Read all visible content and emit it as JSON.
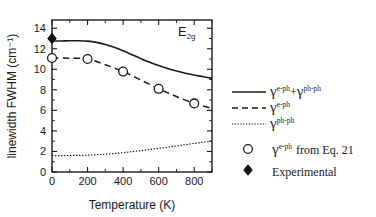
{
  "chart_data": {
    "type": "line",
    "title": "",
    "xlabel": "Temperature (K)",
    "ylabel": "linewidth FWHM (cm⁻¹)",
    "xlim": [
      0,
      900
    ],
    "ylim": [
      0,
      14.8
    ],
    "grid": false,
    "xticks": [
      0,
      200,
      400,
      600,
      800
    ],
    "xticklabels": [
      "0",
      "200",
      "400",
      "600",
      "800"
    ],
    "xminorticks": [
      100,
      300,
      500,
      700,
      900
    ],
    "yticks": [
      0,
      2,
      4,
      6,
      8,
      10,
      12,
      14
    ],
    "yticklabels": [
      "0",
      "2",
      "4",
      "6",
      "8",
      "10",
      "12",
      "14"
    ],
    "yminorticks": [
      1,
      3,
      5,
      7,
      9,
      11,
      13
    ],
    "annotation": "E2g",
    "annotation_base": "E",
    "annotation_sub": "2g",
    "legend_position": "right-outside",
    "series": [
      {
        "name": "gamma_e-ph_plus_ph-ph",
        "style": "solid",
        "label_base": "γ",
        "label_sup1": "e-ph",
        "label_plus": "+",
        "label_base2": "γ",
        "label_sup2": "ph-ph",
        "x": [
          0,
          50,
          100,
          150,
          200,
          250,
          300,
          350,
          400,
          450,
          500,
          550,
          600,
          650,
          700,
          750,
          800,
          850,
          900
        ],
        "y": [
          12.75,
          12.76,
          12.78,
          12.78,
          12.74,
          12.62,
          12.42,
          12.14,
          11.8,
          11.42,
          11.04,
          10.68,
          10.36,
          10.08,
          9.84,
          9.62,
          9.44,
          9.28,
          9.12
        ]
      },
      {
        "name": "gamma_e-ph",
        "style": "dashed",
        "label_base": "γ",
        "label_sup1": "e-ph",
        "x": [
          0,
          100,
          200,
          300,
          400,
          500,
          600,
          700,
          800,
          900
        ],
        "y": [
          11.1,
          11.08,
          11.0,
          10.45,
          9.78,
          8.95,
          8.1,
          7.35,
          6.68,
          6.2
        ]
      },
      {
        "name": "gamma_ph-ph",
        "style": "dotted",
        "label_base": "γ",
        "label_sup1": "ph-ph",
        "x": [
          0,
          50,
          100,
          150,
          200,
          250,
          300,
          350,
          400,
          450,
          500,
          550,
          600,
          650,
          700,
          750,
          800,
          850,
          900
        ],
        "y": [
          1.6,
          1.6,
          1.61,
          1.62,
          1.64,
          1.68,
          1.73,
          1.8,
          1.88,
          1.98,
          2.08,
          2.19,
          2.31,
          2.42,
          2.54,
          2.66,
          2.78,
          2.9,
          3.0
        ]
      },
      {
        "name": "gamma_e-ph_from_eq21",
        "style": "open-circle",
        "label_base": "γ",
        "label_sup1": "e-ph",
        "label_tail": "from Eq. 21",
        "x": [
          0,
          200,
          400,
          600,
          800
        ],
        "y": [
          11.1,
          11.0,
          9.78,
          8.1,
          6.68
        ]
      },
      {
        "name": "experimental",
        "style": "filled-diamond",
        "label": "Experimental",
        "x": [
          0
        ],
        "y": [
          13.0
        ]
      }
    ]
  },
  "legend": {
    "entries": [
      {
        "marker": "solid-line",
        "base": "γ",
        "sup": "e-ph",
        "plus": "+",
        "base2": "γ",
        "sup2": "ph-ph",
        "tail": ""
      },
      {
        "marker": "dashed-line",
        "base": "γ",
        "sup": "e-ph",
        "plus": "",
        "base2": "",
        "sup2": "",
        "tail": ""
      },
      {
        "marker": "dotted-line",
        "base": "γ",
        "sup": "ph-ph",
        "plus": "",
        "base2": "",
        "sup2": "",
        "tail": ""
      },
      {
        "marker": "open-circle",
        "base": "γ",
        "sup": "e-ph",
        "plus": "",
        "base2": "",
        "sup2": "",
        "tail": "from Eq. 21"
      },
      {
        "marker": "filled-diamond",
        "base": "",
        "sup": "",
        "plus": "",
        "base2": "",
        "sup2": "",
        "tail": "Experimental"
      }
    ]
  },
  "colors": {
    "ink": "#1a1a1a",
    "background": "#ffffff",
    "marker_fill": "#ffffff",
    "diamond_fill": "#111111"
  }
}
